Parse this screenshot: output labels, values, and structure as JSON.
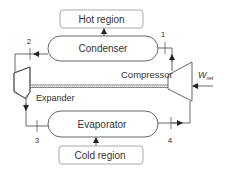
{
  "diagram": {
    "type": "refrigeration-cycle",
    "regions": {
      "hot": "Hot region",
      "cold": "Cold region"
    },
    "components": {
      "condenser": "Condenser",
      "evaporator": "Evaporator",
      "compressor": "Compressor",
      "expander": "Expander"
    },
    "work": {
      "symbol": "W",
      "subscript": "net"
    },
    "state_points": [
      "1",
      "2",
      "3",
      "4"
    ]
  },
  "colors": {
    "line": "#333333",
    "box_border": "#999999",
    "text": "#333333"
  }
}
